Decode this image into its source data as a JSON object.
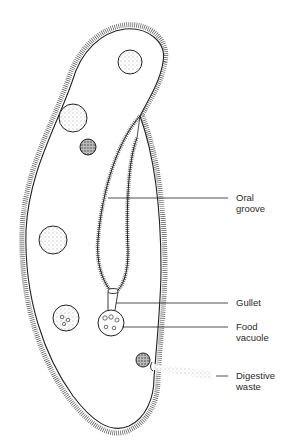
{
  "diagram": {
    "colors": {
      "line": "#222222",
      "background": "#ffffff"
    },
    "labels": [
      {
        "id": "oral-groove",
        "lines": [
          "Oral",
          "groove"
        ]
      },
      {
        "id": "gullet",
        "lines": [
          "Gullet"
        ]
      },
      {
        "id": "food-vacuole",
        "lines": [
          "Food",
          "vacuole"
        ]
      },
      {
        "id": "digestive-waste",
        "lines": [
          "Digestive",
          "waste"
        ]
      }
    ]
  }
}
